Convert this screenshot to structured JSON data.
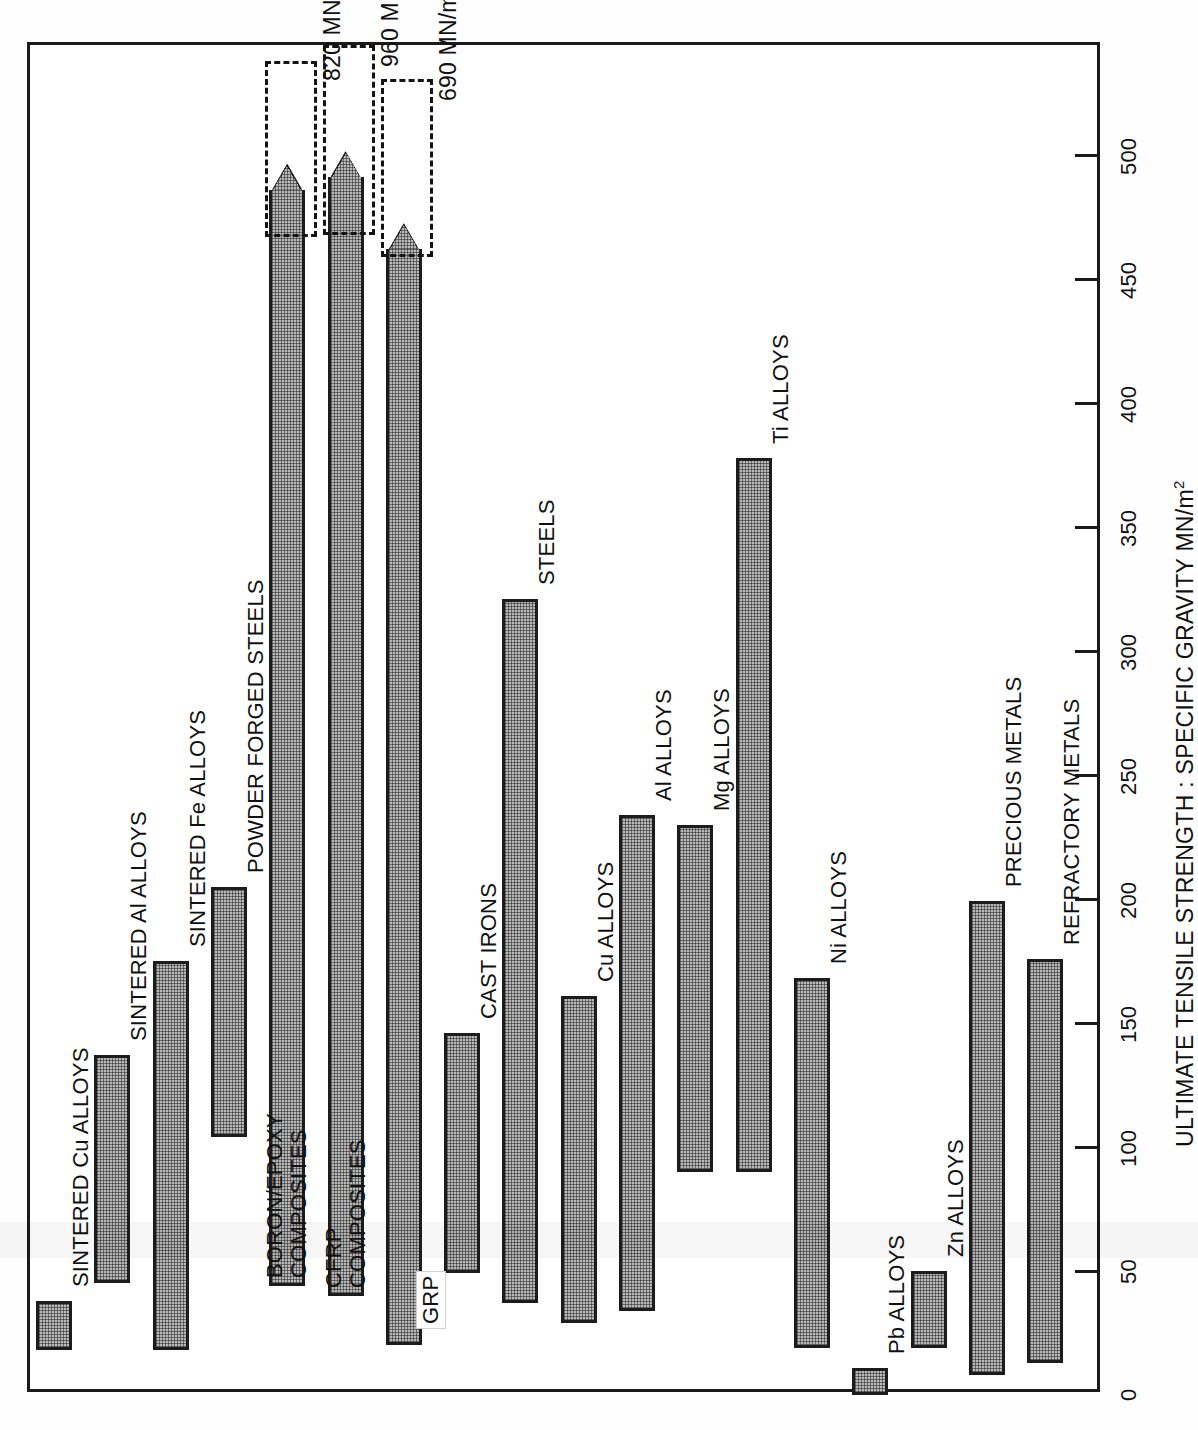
{
  "axis": {
    "title_text": "ULTIMATE TENSILE STRENGTH : SPECIFIC GRAVITY MN/m",
    "title_sup": "2",
    "ticks": [
      "0",
      "50",
      "100",
      "150",
      "200",
      "250",
      "300",
      "350",
      "400",
      "450",
      "500"
    ]
  },
  "annotations": [
    {
      "value": "820 MN/m",
      "sup": "2",
      "for": "BORON/EPOXY COMPOSITES"
    },
    {
      "value": "960 MN/m",
      "sup": "2",
      "for": "CFRP COMPOSITES"
    },
    {
      "value": "690 MN/m",
      "sup": "2",
      "for": "GRP"
    }
  ],
  "chart_data": {
    "type": "bar",
    "orientation": "vertical-bars-rotated",
    "title": "",
    "xlabel": "",
    "ylabel": "ULTIMATE TENSILE STRENGTH : SPECIFIC GRAVITY MN/m2",
    "ylim": [
      0,
      530
    ],
    "ticks": [
      0,
      50,
      100,
      150,
      200,
      250,
      300,
      350,
      400,
      450,
      500
    ],
    "grid": false,
    "legend": null,
    "note": "Each bar is a range (low to high) of UTS:SG ratio for the material class.",
    "categories": [
      "SINTERED Cu ALLOYS",
      "SINTERED Al ALLOYS",
      "SINTERED Fe ALLOYS",
      "POWDER FORGED STEELS",
      "BORON/EPOXY COMPOSITES",
      "CFRP COMPOSITES",
      "GRP",
      "CAST IRONS",
      "STEELS",
      "Cu ALLOYS",
      "Al ALLOYS",
      "Mg ALLOYS",
      "Ti ALLOYS",
      "Ni ALLOYS",
      "Pb ALLOYS",
      "Zn ALLOYS",
      "PRECIOUS METALS",
      "REFRACTORY METALS"
    ],
    "ranges": [
      {
        "category": "SINTERED Cu ALLOYS",
        "low": 18,
        "high": 38,
        "offscale": false,
        "offscale_label": ""
      },
      {
        "category": "SINTERED Al ALLOYS",
        "low": 45,
        "high": 137,
        "offscale": false,
        "offscale_label": ""
      },
      {
        "category": "SINTERED Fe ALLOYS",
        "low": 18,
        "high": 175,
        "offscale": false,
        "offscale_label": ""
      },
      {
        "category": "POWDER FORGED STEELS",
        "low": 104,
        "high": 205,
        "offscale": false,
        "offscale_label": ""
      },
      {
        "category": "BORON/EPOXY COMPOSITES",
        "low": 44,
        "high": 486,
        "offscale": true,
        "offscale_label": "820 MN/m2"
      },
      {
        "category": "CFRP COMPOSITES",
        "low": 40,
        "high": 491,
        "offscale": true,
        "offscale_label": "960 MN/m2"
      },
      {
        "category": "GRP",
        "low": 20,
        "high": 462,
        "offscale": true,
        "offscale_label": "690 MN/m2"
      },
      {
        "category": "CAST IRONS",
        "low": 49,
        "high": 146,
        "offscale": false,
        "offscale_label": ""
      },
      {
        "category": "STEELS",
        "low": 37,
        "high": 321,
        "offscale": false,
        "offscale_label": ""
      },
      {
        "category": "Cu ALLOYS",
        "low": 29,
        "high": 161,
        "offscale": false,
        "offscale_label": ""
      },
      {
        "category": "Al ALLOYS",
        "low": 34,
        "high": 234,
        "offscale": false,
        "offscale_label": ""
      },
      {
        "category": "Mg ALLOYS",
        "low": 90,
        "high": 230,
        "offscale": false,
        "offscale_label": ""
      },
      {
        "category": "Ti ALLOYS",
        "low": 90,
        "high": 378,
        "offscale": false,
        "offscale_label": ""
      },
      {
        "category": "Ni ALLOYS",
        "low": 19,
        "high": 168,
        "offscale": false,
        "offscale_label": ""
      },
      {
        "category": "Pb ALLOYS",
        "low": 0,
        "high": 11,
        "offscale": false,
        "offscale_label": ""
      },
      {
        "category": "Zn ALLOYS",
        "low": 19,
        "high": 50,
        "offscale": false,
        "offscale_label": ""
      },
      {
        "category": "PRECIOUS METALS",
        "low": 8,
        "high": 199,
        "offscale": false,
        "offscale_label": ""
      },
      {
        "category": "REFRACTORY METALS",
        "low": 13,
        "high": 176,
        "offscale": false,
        "offscale_label": ""
      }
    ]
  },
  "colors": {
    "bar_fill": "#b9b9b9",
    "bar_stroke": "#1c1c1c",
    "axis": "#1a1a1a",
    "text": "#111111",
    "background": "#ffffff"
  }
}
